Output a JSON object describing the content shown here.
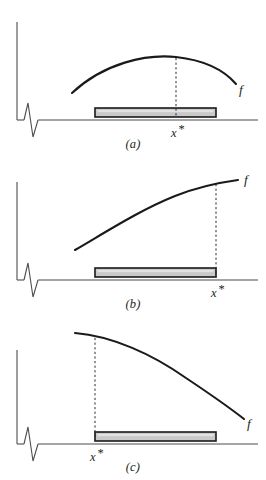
{
  "figure": {
    "function_label": "f",
    "optimum_label": "x*",
    "optimum_label_base": "x",
    "optimum_label_star": "*"
  },
  "panels": [
    {
      "id": "a",
      "caption": "(a)",
      "function_label": "f",
      "optimum_label": "x",
      "optimum_star": "*",
      "description": "interior maximum: concave curve peaks above the interval",
      "axis": {
        "vertical_x": 17,
        "vertical_top": 22,
        "vertical_bottom": 120,
        "horizontal_y": 120,
        "horizontal_x_start": 17,
        "horizontal_x_end": 258
      },
      "interval": {
        "x_start": 95,
        "y_top": 108,
        "x_end": 216,
        "height": 9
      },
      "curve": {
        "type": "concave-arc",
        "start": [
          72,
          93
        ],
        "peak": [
          176,
          58
        ],
        "end": [
          236,
          84
        ]
      },
      "optimum": {
        "x": 176,
        "drop_top": 58,
        "drop_bottom": 118,
        "label_x": 176,
        "label_y": 134
      },
      "f_label_pos": [
        241,
        90
      ]
    },
    {
      "id": "b",
      "caption": "(b)",
      "function_label": "f",
      "optimum_label": "x",
      "optimum_star": "*",
      "description": "boundary maximum at the right end of the interval: increasing curve",
      "axis": {
        "vertical_x": 17,
        "vertical_top": 22,
        "vertical_bottom": 120,
        "horizontal_y": 120,
        "horizontal_x_start": 17,
        "horizontal_x_end": 258
      },
      "interval": {
        "x_start": 95,
        "y_top": 108,
        "x_end": 216,
        "height": 9
      },
      "curve": {
        "type": "increasing-concave",
        "start": [
          75,
          90
        ],
        "end": [
          238,
          20
        ]
      },
      "optimum": {
        "x": 216,
        "drop_top": 24,
        "drop_bottom": 118,
        "label_x": 216,
        "label_y": 134
      },
      "f_label_pos": [
        245,
        22
      ]
    },
    {
      "id": "c",
      "caption": "(c)",
      "function_label": "f",
      "optimum_label": "x",
      "optimum_star": "*",
      "description": "boundary maximum at the left end of the interval: decreasing curve",
      "axis": {
        "vertical_x": 17,
        "vertical_top": 22,
        "vertical_bottom": 120,
        "horizontal_y": 120,
        "horizontal_x_start": 17,
        "horizontal_x_end": 258
      },
      "interval": {
        "x_start": 95,
        "y_top": 108,
        "x_end": 216,
        "height": 9
      },
      "curve": {
        "type": "decreasing-concave",
        "start": [
          75,
          13
        ],
        "end": [
          244,
          82
        ]
      },
      "optimum": {
        "x": 95,
        "drop_top": 18,
        "drop_bottom": 118,
        "label_x": 95,
        "label_y": 134
      },
      "f_label_pos": [
        248,
        92
      ]
    }
  ],
  "colors": {
    "background": "#ffffff",
    "axis": "#4d4d4d",
    "curve": "#1a1a1a",
    "bar_fill": "#c9c9c9",
    "bar_stroke": "#1a1a1a",
    "text": "#231f20"
  }
}
